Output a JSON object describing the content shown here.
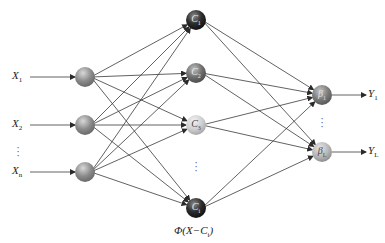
{
  "diagram": {
    "type": "radial-basis-function-network",
    "colors": {
      "background": "#ffffff",
      "edge": "#3a3a3a",
      "input_node": "#8a8a8a",
      "hidden_dark": "#2e2e2e",
      "hidden_mid": "#6e6e6e",
      "hidden_light": "#d0d0d0",
      "output_mid": "#7a7a7a",
      "output_light": "#b8b8b8"
    },
    "inputs": [
      {
        "label": "X",
        "sub": "1",
        "y": 77
      },
      {
        "label": "X",
        "sub": "2",
        "y": 125
      },
      {
        "label": "X",
        "sub": "n",
        "y": 172
      }
    ],
    "hidden": [
      {
        "label": "C",
        "sub": "1",
        "y": 20,
        "shade": "dark"
      },
      {
        "label": "C",
        "sub": "2",
        "y": 73,
        "shade": "mid"
      },
      {
        "label": "C",
        "sub": "3",
        "y": 125,
        "shade": "light"
      },
      {
        "label": "C",
        "sub": "i",
        "y": 208,
        "shade": "dark"
      }
    ],
    "outputs": [
      {
        "label": "β",
        "sub": "1",
        "y": 95,
        "shade": "mid",
        "out_label": "Y",
        "out_sub": "1"
      },
      {
        "label": "β",
        "sub": "L",
        "y": 152,
        "shade": "light",
        "out_label": "Y",
        "out_sub": "L"
      }
    ],
    "activation_label": "Φ(X−C",
    "activation_sub": "i",
    "activation_close": ")",
    "ellipsis": "⋮",
    "layout": {
      "input_label_x": 12,
      "input_node_x": 85,
      "hidden_x": 196,
      "output_x": 322,
      "output_label_x": 368,
      "node_r": 10
    }
  }
}
